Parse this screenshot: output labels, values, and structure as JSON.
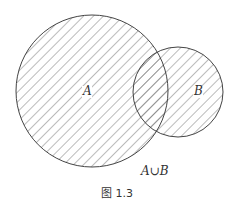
{
  "diagram": {
    "type": "venn",
    "sets": [
      {
        "name": "A",
        "label": "A"
      },
      {
        "name": "B",
        "label": "B"
      }
    ],
    "shaded_region": "A ∪ B",
    "region_label": "A∪B",
    "caption": "图 1.3",
    "colors": {
      "stroke": "#444444",
      "hatch": "#555555",
      "background": "#ffffff"
    }
  }
}
